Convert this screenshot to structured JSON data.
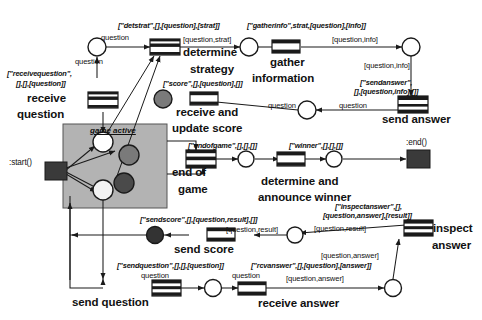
{
  "diagram": {
    "canvas": {
      "width": 482,
      "height": 320
    },
    "colors": {
      "background": "#ffffff",
      "subnet_fill": "#b3b3b3",
      "subnet_stroke": "#4d4d4d",
      "place_fill": "#ffffff",
      "place_stroke": "#1a1a1a",
      "marked_place_fill": "#7a7a7a",
      "marked_place_dark_fill": "#4a4a4a",
      "transition_fill": "#ffffff",
      "transition_bar_fill": "#1a1a1a",
      "terminal_fill": "#3a3a3a",
      "arc_stroke": "#1a1a1a",
      "text": "#111111"
    }
  },
  "terminals": {
    "start_label": ":start()",
    "end_label": ":end()"
  },
  "subnet": {
    "label": "game active"
  },
  "transitions": [
    {
      "id": "receive-question",
      "name": "receive\nquestion",
      "annotation": "[\"receivequestion\",\n[],[],[question]]"
    },
    {
      "id": "determine-strategy",
      "name": "determine\nstrategy",
      "annotation": "[\"detstrat\",[],[question],[strat]]"
    },
    {
      "id": "gather-information",
      "name": "gather\ninformation",
      "annotation": "[\"gatherinfo\",strat,[question],[info]]"
    },
    {
      "id": "send-answer",
      "name": "send answer",
      "annotation": "[\"sendanswer\",\n[],[question,info],[]]"
    },
    {
      "id": "receive-and-update-score",
      "name": "receive and\nupdate score",
      "annotation": "[\"score\",[],[question],[]]"
    },
    {
      "id": "end-of-game",
      "name": "end of\ngame",
      "annotation": "[\"endofgame\",[],[],[]]"
    },
    {
      "id": "determine-and-announce-winner",
      "name": "determine and\nannounce winner",
      "annotation": "[\"winner\",[],[],[]]"
    },
    {
      "id": "inspect-answer",
      "name": "inspect\nanswer",
      "annotation": "[\"inspectanswer\",[],\n[question,answer],[result]]"
    },
    {
      "id": "send-score",
      "name": "send score",
      "annotation": "[\"sendscore\",[],[question,result],[]]"
    },
    {
      "id": "send-question",
      "name": "send question",
      "annotation": "[\"sendquestion\",[],[],[question]]"
    },
    {
      "id": "receive-answer",
      "name": "receive answer",
      "annotation": "[\"rcvanswer\",[],[question],[answer]]"
    }
  ],
  "arc_labels": {
    "a_question_top": "question",
    "a_question_to_receive": "question",
    "a_question_strat": "[question,strat]",
    "a_question_info_top": "[question,info]",
    "a_question_info_down": "[question,info]",
    "a_question_sendanswer": "question",
    "a_question_score": "question",
    "a_question_result_top": "[question,result]",
    "a_question_result_low": "[question,result]",
    "a_question_answer_up": "[question,answer]",
    "a_question_answer_low": "[question,answer]",
    "a_question_sendq": "question",
    "a_question_rcvans": "question"
  },
  "annotation_texts": {
    "detstrat": "[\"detstrat\",[],[question],[strat]]",
    "receivequestion": [
      "[\"receivequestion\",",
      "[],[],[question]]"
    ],
    "gatherinfo": "[\"gatherinfo\",strat,[question],[info]]",
    "sendanswer": [
      "[\"sendanswer\",",
      "[],[question,info],[]]"
    ],
    "score": "[\"score\",[],[question],[]]",
    "endofgame": "[\"endofgame\",[],[],[]]",
    "winner": "[\"winner\",[],[],[]]",
    "inspectanswer": [
      "[\"inspectanswer\",[],",
      "[question,answer],[result]]"
    ],
    "sendscore": "[\"sendscore\",[],[question,result],[]]",
    "sendquestion": "[\"sendquestion\",[],[],[question]]",
    "rcvanswer": "[\"rcvanswer\",[],[question],[answer]]"
  },
  "names": {
    "receive_question_1": "receive",
    "receive_question_2": "question",
    "determine_strategy_1": "determine",
    "determine_strategy_2": "strategy",
    "gather_information_1": "gather",
    "gather_information_2": "information",
    "send_answer": "send answer",
    "receive_update_1": "receive and",
    "receive_update_2": "update score",
    "end_of_game_1": "end of",
    "end_of_game_2": "game",
    "winner_1": "determine and",
    "winner_2": "announce winner",
    "inspect_1": "inspect",
    "inspect_2": "answer",
    "send_score": "send score",
    "send_question": "send question",
    "receive_answer": "receive answer"
  }
}
